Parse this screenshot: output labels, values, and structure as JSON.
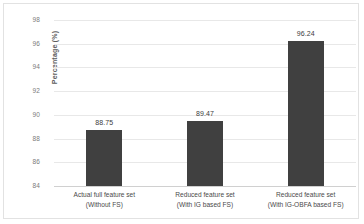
{
  "chart_data": {
    "type": "bar",
    "title": "",
    "xlabel": "",
    "ylabel": "Percentage (%)",
    "ylim": [
      84,
      98
    ],
    "grid": true,
    "legend": "none",
    "categories": [
      "Actual full feature set (Without FS)",
      "Reduced feature set (With IG based FS)",
      "Reduced feature set (With IG-OBFA based FS)"
    ],
    "category_lines": [
      [
        "Actual full feature set",
        "(Without FS)"
      ],
      [
        "Reduced feature set",
        "(With IG based FS)"
      ],
      [
        "Reduced feature set",
        "(With IG-OBFA based FS)"
      ]
    ],
    "values": [
      88.75,
      89.47,
      96.24
    ],
    "value_labels": [
      "88.75",
      "89.47",
      "96.24"
    ],
    "ytick_labels": [
      "98",
      "96",
      "94",
      "92",
      "90",
      "88",
      "86",
      "84"
    ],
    "ytick_values": [
      98,
      96,
      94,
      92,
      90,
      88,
      86,
      84
    ],
    "bar_color": "#404040",
    "gridline_color": "#e8e8e8",
    "axis_line_color": "#d0d0d0",
    "border_color": "#e2e2e2",
    "tick_label_color": "#7a7a7a",
    "axis_title_color": "#5c5c5c"
  }
}
